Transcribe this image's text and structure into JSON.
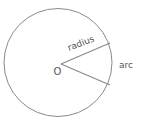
{
  "diagram": {
    "title": "",
    "labels": {
      "radius": "radius",
      "arc": "arc",
      "center": "O"
    },
    "colors": {
      "stroke": "#8a8a8a",
      "text": "#555555",
      "background": "#ffffff"
    },
    "circle": {
      "cx": 58,
      "cy": 62.5,
      "r": 54
    },
    "radius_lines": [
      {
        "x1": 61,
        "y1": 64,
        "x2": 110,
        "y2": 43
      },
      {
        "x1": 61,
        "y1": 64,
        "x2": 110,
        "y2": 85
      }
    ]
  }
}
